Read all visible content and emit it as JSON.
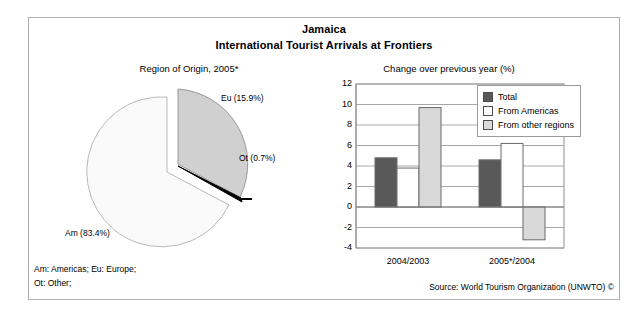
{
  "header": {
    "country": "Jamaica",
    "subtitle": "International Tourist Arrivals at Frontiers"
  },
  "pie_panel": {
    "subtitle": "Region of Origin, 2005*"
  },
  "bar_panel": {
    "subtitle": "Change over previous year (%)"
  },
  "footnotes": {
    "line1": "Am: Americas; Eu: Europe;",
    "line2": "Ot: Other;",
    "source": "Source: World Tourism Organization (UNWTO) ©"
  },
  "colors": {
    "total": "#595959",
    "from_americas": "#ffffff",
    "from_other_regions": "#d9d9d9",
    "pie_am": "#fafafa",
    "pie_eu": "#d0d0d0",
    "pie_ot": "#000000",
    "frame": "#b0b0b0",
    "gridline": "#a8a8a8"
  },
  "chart_data": [
    {
      "type": "pie",
      "title": "Region of Origin, 2005*",
      "labels": [
        "Am",
        "Eu",
        "Ot"
      ],
      "label_texts": [
        "Am (83.4%)",
        "Eu (15.9%)",
        "Ot (0.7%)"
      ],
      "values": [
        83.4,
        15.9,
        0.7
      ],
      "units": "%",
      "legend": "none",
      "notes": "Am: Americas; Eu: Europe; Ot: Other;"
    },
    {
      "type": "bar",
      "title": "Change over previous year (%)",
      "xlabel": "",
      "ylabel": "",
      "categories": [
        "2004/2003",
        "2005*/2004"
      ],
      "series": [
        {
          "name": "Total",
          "values": [
            4.8,
            4.6
          ]
        },
        {
          "name": "From Americas",
          "values": [
            3.8,
            6.2
          ]
        },
        {
          "name": "From other regions",
          "values": [
            9.7,
            -3.2
          ]
        }
      ],
      "ylim": [
        -4,
        12
      ],
      "yticks": [
        12,
        10,
        8,
        6,
        4,
        2,
        0,
        -2,
        -4
      ],
      "grid": true,
      "legend_position": "top-right"
    }
  ]
}
